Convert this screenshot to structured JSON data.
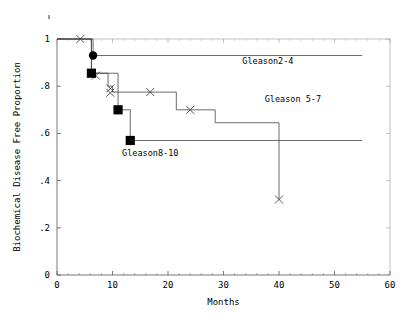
{
  "chart_data": {
    "type": "line",
    "title": "",
    "xlabel": "Months",
    "ylabel": "Biochemical Disease Free Proportion",
    "xlim": [
      0,
      60
    ],
    "ylim": [
      0,
      1
    ],
    "xticks": [
      0,
      10,
      20,
      30,
      40,
      50,
      60
    ],
    "xticklabels": [
      "0",
      "10",
      "20",
      "30",
      "40",
      "50",
      "60"
    ],
    "yticks": [
      0,
      0.2,
      0.4,
      0.6,
      0.8,
      1.0
    ],
    "yticklabels": [
      "0",
      ".2",
      ".4",
      ".6",
      ".8",
      "1"
    ],
    "grid": false,
    "legend_position": "inline-annotations",
    "series": [
      {
        "name": "Gleason2-4",
        "label": "Gleason2-4",
        "label_x": 38,
        "label_y": 0.895,
        "marker": "filled-circle",
        "steps": [
          {
            "x": 0,
            "y": 1.0
          },
          {
            "x": 6.5,
            "y": 1.0
          },
          {
            "x": 6.5,
            "y": 0.93
          },
          {
            "x": 55,
            "y": 0.93
          }
        ],
        "censored": [
          {
            "x": 4.2,
            "y": 1.0
          }
        ],
        "events": [
          {
            "x": 6.5,
            "y": 0.93
          }
        ]
      },
      {
        "name": "Gleason 5-7",
        "label": "Gleason 5-7",
        "label_x": 42.5,
        "label_y": 0.735,
        "marker": "x-censor",
        "steps": [
          {
            "x": 0,
            "y": 1.0
          },
          {
            "x": 6.2,
            "y": 1.0
          },
          {
            "x": 6.2,
            "y": 0.855
          },
          {
            "x": 9.2,
            "y": 0.855
          },
          {
            "x": 9.2,
            "y": 0.8
          },
          {
            "x": 10.0,
            "y": 0.8
          },
          {
            "x": 10.0,
            "y": 0.775
          },
          {
            "x": 21.5,
            "y": 0.775
          },
          {
            "x": 21.5,
            "y": 0.7
          },
          {
            "x": 28.5,
            "y": 0.7
          },
          {
            "x": 28.5,
            "y": 0.645
          },
          {
            "x": 40.0,
            "y": 0.645
          },
          {
            "x": 40.0,
            "y": 0.32
          }
        ],
        "censored": [
          {
            "x": 7.0,
            "y": 0.845
          },
          {
            "x": 9.6,
            "y": 0.79
          },
          {
            "x": 9.6,
            "y": 0.772
          },
          {
            "x": 16.8,
            "y": 0.775
          },
          {
            "x": 24.0,
            "y": 0.7
          },
          {
            "x": 40.0,
            "y": 0.32
          }
        ]
      },
      {
        "name": "Gleason8-10",
        "label": "Gleason8-10",
        "label_x": 16.8,
        "label_y": 0.505,
        "marker": "filled-square",
        "steps": [
          {
            "x": 0,
            "y": 1.0
          },
          {
            "x": 6.2,
            "y": 1.0
          },
          {
            "x": 6.2,
            "y": 0.855
          },
          {
            "x": 11.0,
            "y": 0.855
          },
          {
            "x": 11.0,
            "y": 0.7
          },
          {
            "x": 13.2,
            "y": 0.7
          },
          {
            "x": 13.2,
            "y": 0.57
          },
          {
            "x": 55,
            "y": 0.57
          }
        ],
        "events": [
          {
            "x": 6.2,
            "y": 0.855
          },
          {
            "x": 11.0,
            "y": 0.7
          },
          {
            "x": 13.2,
            "y": 0.57
          }
        ]
      }
    ],
    "annotations": [
      {
        "text": "Gleason2-4",
        "x": 38,
        "y": 0.895
      },
      {
        "text": "Gleason 5-7",
        "x": 42.5,
        "y": 0.735
      },
      {
        "text": "Gleason8-10",
        "x": 16.8,
        "y": 0.505
      }
    ]
  }
}
